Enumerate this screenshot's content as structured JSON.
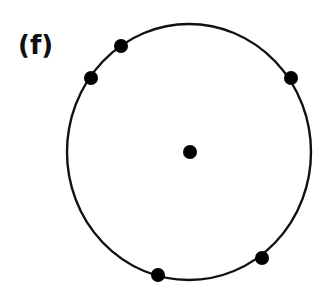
{
  "panel_label": "(f)",
  "diagram": {
    "circle": {
      "cx": 189,
      "cy": 152,
      "rx": 122,
      "ry": 128,
      "stroke": "#111111"
    },
    "center_point": {
      "x": 190,
      "y": 152
    },
    "boundary_points": [
      {
        "x": 121,
        "y": 46
      },
      {
        "x": 91,
        "y": 78
      },
      {
        "x": 291,
        "y": 78
      },
      {
        "x": 262,
        "y": 258
      },
      {
        "x": 158,
        "y": 275
      }
    ],
    "point_color": "#000000"
  }
}
